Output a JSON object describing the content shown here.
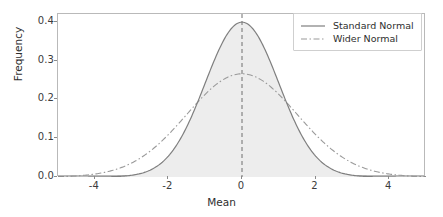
{
  "chart_data": {
    "type": "line",
    "title": "",
    "xlabel": "Mean",
    "ylabel": "Frequency",
    "xlim": [
      -5,
      5
    ],
    "ylim": [
      0,
      0.42
    ],
    "xticks": [
      "-4",
      "-2",
      "0",
      "2",
      "4"
    ],
    "xtick_values": [
      -4,
      -2,
      0,
      2,
      4
    ],
    "yticks": [
      "0.0",
      "0.1",
      "0.2",
      "0.3",
      "0.4"
    ],
    "ytick_values": [
      0.0,
      0.1,
      0.2,
      0.3,
      0.4
    ],
    "grid": false,
    "legend_position": "upper right",
    "series": [
      {
        "name": "Standard Normal",
        "style": "solid",
        "color": "#7f7f7f",
        "mean": 0,
        "sigma": 1,
        "peak": 0.399,
        "filled": true,
        "fill_color": "#ededed",
        "x": [
          -5,
          -4.5,
          -4,
          -3.5,
          -3,
          -2.5,
          -2,
          -1.5,
          -1,
          -0.5,
          0,
          0.5,
          1,
          1.5,
          2,
          2.5,
          3,
          3.5,
          4,
          4.5,
          5
        ],
        "values": [
          0.0,
          0.0,
          0.0,
          0.001,
          0.004,
          0.018,
          0.054,
          0.13,
          0.242,
          0.352,
          0.399,
          0.352,
          0.242,
          0.13,
          0.054,
          0.018,
          0.004,
          0.001,
          0.0,
          0.0,
          0.0
        ]
      },
      {
        "name": "Wider Normal",
        "style": "dashdot",
        "color": "#9a9a9a",
        "mean": 0,
        "sigma": 1.5,
        "peak": 0.266,
        "filled": false,
        "x": [
          -5,
          -4.5,
          -4,
          -3.5,
          -3,
          -2.5,
          -2,
          -1.5,
          -1,
          -0.5,
          0,
          0.5,
          1,
          1.5,
          2,
          2.5,
          3,
          3.5,
          4,
          4.5,
          5
        ],
        "values": [
          0.001,
          0.003,
          0.007,
          0.016,
          0.036,
          0.07,
          0.12,
          0.177,
          0.228,
          0.258,
          0.266,
          0.258,
          0.228,
          0.177,
          0.12,
          0.07,
          0.036,
          0.016,
          0.007,
          0.003,
          0.001
        ]
      }
    ],
    "annotations": [
      {
        "name": "mean-vertical-line",
        "type": "vline",
        "x": 0,
        "style": "dashed",
        "color": "#6e6e6e"
      }
    ]
  },
  "legend": {
    "entries": [
      {
        "label": "Standard Normal"
      },
      {
        "label": "Wider Normal"
      }
    ]
  }
}
